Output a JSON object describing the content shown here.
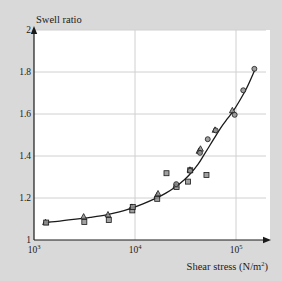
{
  "figure": {
    "background_color": "#d9d9d9",
    "plot_background_color": "#ffffff",
    "grid_color": "#d0d0d0",
    "axis_color": "#1a1a1a",
    "curve_color": "#1a1a1a",
    "marker_fill": "#8f8f8f",
    "marker_edge": "#1a1a1a"
  },
  "chart_data": {
    "type": "scatter",
    "title": "",
    "xlabel": "Shear stress (N/m",
    "xlabel_sup": "2",
    "xlabel_tail": ")",
    "ylabel": "Swell ratio",
    "xscale": "log",
    "yscale": "linear",
    "xlim": [
      1000,
      180000
    ],
    "ylim": [
      1,
      2
    ],
    "grid": true,
    "legend_position": "none",
    "xticks": [
      {
        "value": 1000,
        "mantissa": "10",
        "exponent": "3"
      },
      {
        "value": 10000,
        "mantissa": "10",
        "exponent": "4"
      },
      {
        "value": 100000,
        "mantissa": "10",
        "exponent": "5"
      }
    ],
    "yticks": [
      "1",
      "1.2",
      "1.4",
      "1.6",
      "1.8",
      "2"
    ],
    "ytick_values": [
      1,
      1.2,
      1.4,
      1.6,
      1.8,
      2
    ],
    "series": [
      {
        "name": "triangles",
        "marker": "triangle",
        "points": [
          [
            1300,
            1.085
          ],
          [
            3100,
            1.112
          ],
          [
            5400,
            1.122
          ],
          [
            9300,
            1.158
          ],
          [
            16500,
            1.212
          ],
          [
            16900,
            1.222
          ],
          [
            25500,
            1.262
          ],
          [
            35000,
            1.335
          ],
          [
            43000,
            1.425
          ],
          [
            44500,
            1.435
          ],
          [
            62000,
            1.525
          ],
          [
            92000,
            1.618
          ]
        ]
      },
      {
        "name": "squares",
        "marker": "square",
        "points": [
          [
            1320,
            1.083
          ],
          [
            3150,
            1.086
          ],
          [
            5500,
            1.095
          ],
          [
            9400,
            1.141
          ],
          [
            16600,
            1.196
          ],
          [
            20500,
            1.318
          ],
          [
            25800,
            1.252
          ],
          [
            33500,
            1.278
          ],
          [
            35200,
            1.332
          ],
          [
            51000,
            1.31
          ],
          [
            9500,
            1.157
          ]
        ]
      },
      {
        "name": "circles",
        "marker": "circle",
        "points": [
          [
            25600,
            1.266
          ],
          [
            35100,
            1.33
          ],
          [
            44000,
            1.415
          ],
          [
            52500,
            1.48
          ],
          [
            63000,
            1.522
          ],
          [
            97000,
            1.596
          ],
          [
            118000,
            1.713
          ],
          [
            152000,
            1.815
          ]
        ]
      }
    ],
    "fit_curve": {
      "name": "fitted-curve",
      "points": [
        [
          1250,
          1.083
        ],
        [
          1800,
          1.09
        ],
        [
          2600,
          1.099
        ],
        [
          3600,
          1.108
        ],
        [
          5200,
          1.12
        ],
        [
          7000,
          1.134
        ],
        [
          9300,
          1.152
        ],
        [
          12000,
          1.172
        ],
        [
          16000,
          1.198
        ],
        [
          20000,
          1.222
        ],
        [
          25500,
          1.255
        ],
        [
          31000,
          1.288
        ],
        [
          36000,
          1.32
        ],
        [
          42000,
          1.36
        ],
        [
          48000,
          1.404
        ],
        [
          55000,
          1.45
        ],
        [
          63000,
          1.496
        ],
        [
          72000,
          1.54
        ],
        [
          83000,
          1.58
        ],
        [
          95000,
          1.618
        ],
        [
          110000,
          1.668
        ],
        [
          128000,
          1.725
        ],
        [
          152000,
          1.805
        ]
      ]
    }
  }
}
